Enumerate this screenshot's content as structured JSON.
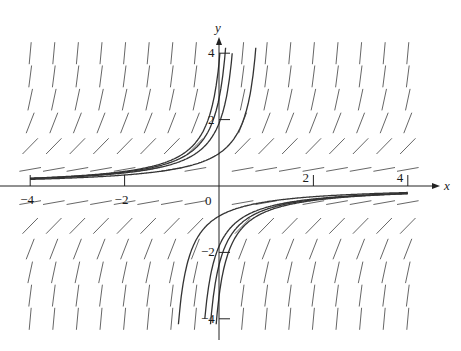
{
  "figure": {
    "type": "slope-field",
    "equation_hint": "dy/dx = y^2",
    "colors": {
      "axis": "#222222",
      "segment": "#555555",
      "curve": "#333333",
      "text": "#1a1a1a"
    }
  },
  "axes": {
    "x_label": "x",
    "y_label": "y",
    "origin_label": "0",
    "x_ticks": [
      {
        "value": -4,
        "label": "−4"
      },
      {
        "value": -2,
        "label": "−2"
      },
      {
        "value": 2,
        "label": "2"
      },
      {
        "value": 4,
        "label": "4"
      }
    ],
    "y_ticks": [
      {
        "value": 4,
        "label": "4"
      },
      {
        "value": 2,
        "label": "2"
      },
      {
        "value": -2,
        "label": "−2"
      },
      {
        "value": -4,
        "label": "−4"
      }
    ],
    "xlim": [
      -4,
      4
    ],
    "ylim": [
      -4,
      4
    ]
  },
  "slope_field": {
    "x_values": [
      -4,
      -3.5,
      -3,
      -2.5,
      -2,
      -1.5,
      -1,
      -0.5,
      0.5,
      1,
      1.5,
      2,
      2.5,
      3,
      3.5,
      4
    ],
    "y_values": [
      4,
      3.3,
      2.6,
      1.9,
      1.2,
      0.5,
      -0.5,
      -1.2,
      -1.9,
      -2.6,
      -3.3,
      -4
    ]
  },
  "solution_curves": {
    "upper_c": [
      0.27,
      0.38,
      0.53,
      1.02
    ],
    "lower_c": [
      -1.1,
      -0.55,
      -0.42,
      -0.3
    ],
    "x_start": -4,
    "x_end": 4
  }
}
